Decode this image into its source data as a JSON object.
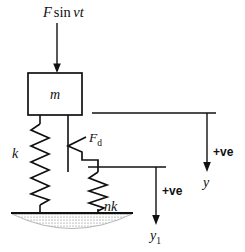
{
  "figure": {
    "type": "mechanical-vibration-free-body-diagram",
    "background_color": "#ffffff",
    "stroke_color": "#111111"
  },
  "labels": {
    "force": {
      "text": "F sin νt",
      "parts": {
        "f": "F",
        "sin": "sin",
        "nu_t": "νt"
      },
      "x": 43,
      "y": 17
    },
    "mass": {
      "text": "m",
      "x": 55,
      "y": 98
    },
    "spring_k": {
      "text": "k",
      "x": 14,
      "y": 157
    },
    "damper_force": {
      "text": "Fₑ",
      "base": "F",
      "sub": "d",
      "x": 89,
      "y": 142
    },
    "spring_nk": {
      "text": "nk",
      "x": 105,
      "y": 210
    },
    "plus_ve_right": {
      "text": "+ve",
      "x": 214,
      "y": 155
    },
    "plus_ve_mid": {
      "text": "+ve",
      "x": 167,
      "y": 193
    },
    "y_right": {
      "text": "y",
      "x": 208,
      "y": 185
    },
    "y1_mid": {
      "base": "y",
      "sub": "1",
      "text": "y₁",
      "x": 156,
      "y": 238
    }
  },
  "components": {
    "mass_block": {
      "x": 28,
      "y": 73,
      "width": 54,
      "height": 42,
      "label": "m"
    },
    "force_arrow": {
      "from_y": 22,
      "to_y": 72,
      "x": 57,
      "direction": "down"
    },
    "left_spring": {
      "label": "k",
      "x": 40,
      "top_y": 123,
      "bottom_y": 213,
      "coils": 9,
      "amplitude": 9
    },
    "damper_rod": {
      "x": 68,
      "top_y": 115,
      "bottom_y": 172
    },
    "damper_symbol": {
      "apex_x": 68,
      "y": 146,
      "label": "Fₑ"
    },
    "right_spring": {
      "label": "nk",
      "x": 98,
      "top_y": 172,
      "bottom_y": 213,
      "coils": 6,
      "amplitude": 9
    },
    "ground": {
      "line_y": 213,
      "x_start": 12,
      "x_end": 132,
      "hatch_style": "stippled-lens"
    },
    "reference_line_upper": {
      "y": 113,
      "x_start": 92,
      "x_end": 216
    },
    "reference_line_lower": {
      "y": 167,
      "x_start": 88,
      "x_end": 166
    },
    "arrow_y": {
      "x": 207,
      "from_y": 113,
      "to_y": 171,
      "label": "y",
      "sense": "+ve"
    },
    "arrow_y1": {
      "x": 156,
      "from_y": 167,
      "to_y": 225,
      "label": "y₁",
      "sense": "+ve"
    }
  }
}
